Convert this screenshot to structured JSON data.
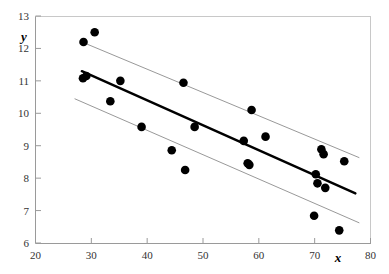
{
  "chart_data": {
    "type": "scatter",
    "title": "",
    "xlabel": "x",
    "ylabel": "y",
    "xlim": [
      20,
      80
    ],
    "ylim": [
      6,
      13
    ],
    "xticks": [
      20,
      30,
      40,
      50,
      60,
      70,
      80
    ],
    "yticks": [
      6,
      7,
      8,
      9,
      10,
      11,
      12,
      13
    ],
    "grid": false,
    "legend": "none",
    "marker_color": "#000000",
    "fit_line_color": "#000000",
    "band_line_color": "#999999",
    "points": [
      {
        "x": 28.6,
        "y": 12.2
      },
      {
        "x": 30.6,
        "y": 12.5
      },
      {
        "x": 28.5,
        "y": 11.08
      },
      {
        "x": 29.1,
        "y": 11.15
      },
      {
        "x": 35.2,
        "y": 11.0
      },
      {
        "x": 33.4,
        "y": 10.37
      },
      {
        "x": 46.5,
        "y": 10.94
      },
      {
        "x": 39.0,
        "y": 9.58
      },
      {
        "x": 58.7,
        "y": 10.1
      },
      {
        "x": 48.5,
        "y": 9.58
      },
      {
        "x": 57.3,
        "y": 9.15
      },
      {
        "x": 61.2,
        "y": 9.28
      },
      {
        "x": 44.4,
        "y": 8.86
      },
      {
        "x": 58.0,
        "y": 8.46
      },
      {
        "x": 58.3,
        "y": 8.41
      },
      {
        "x": 71.2,
        "y": 8.89
      },
      {
        "x": 75.3,
        "y": 8.52
      },
      {
        "x": 71.6,
        "y": 8.74
      },
      {
        "x": 46.8,
        "y": 8.25
      },
      {
        "x": 70.2,
        "y": 8.12
      },
      {
        "x": 70.5,
        "y": 7.84
      },
      {
        "x": 71.9,
        "y": 7.7
      },
      {
        "x": 69.9,
        "y": 6.84
      },
      {
        "x": 74.4,
        "y": 6.39
      }
    ],
    "fit_line": {
      "name": "regression-line",
      "x0": 28.3,
      "y0": 11.3,
      "x1": 77.3,
      "y1": 7.53
    },
    "upper_band": {
      "name": "upper-confidence-line",
      "x0": 28.3,
      "y0": 12.2,
      "x1": 78.0,
      "y1": 8.63
    },
    "lower_band": {
      "name": "lower-confidence-line",
      "x0": 27.0,
      "y0": 10.45,
      "x1": 78.0,
      "y1": 6.62
    }
  }
}
